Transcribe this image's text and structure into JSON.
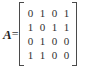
{
  "equation": {
    "symbol": "A",
    "equals": "=",
    "matrix": {
      "name": "adjacency-matrix",
      "rows": 4,
      "columns": 4,
      "bracket_style": "square",
      "values": [
        [
          "0",
          "1",
          "0",
          "1"
        ],
        [
          "1",
          "0",
          "1",
          "1"
        ],
        [
          "0",
          "1",
          "0",
          "0"
        ],
        [
          "1",
          "1",
          "0",
          "0"
        ]
      ]
    }
  },
  "colors": {
    "background": "#ffffff",
    "text": "#2f2f2f",
    "symbol": "#232323",
    "bracket": "#4a4a4a"
  }
}
